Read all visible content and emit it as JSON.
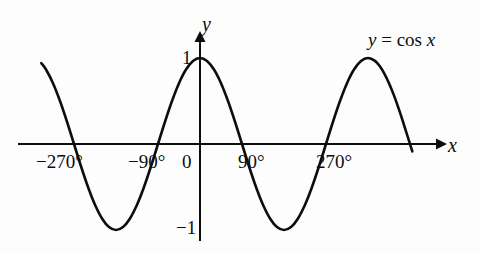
{
  "figure": {
    "background_color": "#fdfdfd",
    "ink_color": "#0d0d0d"
  },
  "axes": {
    "x_axis_name": "x",
    "y_axis_name": "y",
    "x_tick_labels": [
      "−270°",
      "−90°",
      "0",
      "90°",
      "270°"
    ],
    "y_tick_labels": [
      "1",
      "−1"
    ]
  },
  "annotations": {
    "equation_y": "y",
    "equation_eq": "=",
    "equation_fn": "cos",
    "equation_var": "x"
  },
  "chart_data": {
    "type": "line",
    "xlabel": "x",
    "ylabel": "y",
    "grid": false,
    "legend": "none",
    "annotations": [
      "y = cos x"
    ],
    "xlim": [
      -380,
      450
    ],
    "ylim": [
      -1,
      1
    ],
    "x_unit": "degrees",
    "xticks": [
      -270,
      -90,
      0,
      90,
      270
    ],
    "xticklabels": [
      "−270°",
      "−90°",
      "0",
      "90°",
      "270°"
    ],
    "yticks": [
      1,
      -1
    ],
    "yticklabels": [
      "1",
      "−1"
    ],
    "series": [
      {
        "name": "y = cos x",
        "x": [
          -340,
          -330,
          -315,
          -300,
          -285,
          -270,
          -255,
          -240,
          -225,
          -210,
          -195,
          -180,
          -165,
          -150,
          -135,
          -120,
          -105,
          -90,
          -75,
          -60,
          -45,
          -30,
          -15,
          0,
          15,
          30,
          45,
          60,
          75,
          90,
          105,
          120,
          135,
          150,
          165,
          180,
          195,
          210,
          225,
          240,
          255,
          270,
          285,
          300,
          315,
          330,
          345,
          360,
          375,
          385,
          395,
          405,
          415,
          425,
          435,
          445,
          455
        ],
        "y": [
          0.94,
          0.866,
          0.707,
          0.5,
          0.259,
          0.0,
          -0.259,
          -0.5,
          -0.707,
          -0.866,
          -0.966,
          -1.0,
          -0.966,
          -0.866,
          -0.707,
          -0.5,
          -0.259,
          0.0,
          0.259,
          0.5,
          0.707,
          0.866,
          0.966,
          1.0,
          0.966,
          0.866,
          0.707,
          0.5,
          0.259,
          0.0,
          -0.259,
          -0.5,
          -0.707,
          -0.866,
          -0.966,
          -1.0,
          -0.966,
          -0.866,
          -0.707,
          -0.5,
          -0.259,
          0.0,
          0.259,
          0.5,
          0.707,
          0.866,
          0.966,
          1.0,
          0.966,
          0.906,
          0.819,
          0.707,
          0.574,
          0.423,
          0.259,
          0.087,
          -0.087
        ]
      }
    ]
  }
}
